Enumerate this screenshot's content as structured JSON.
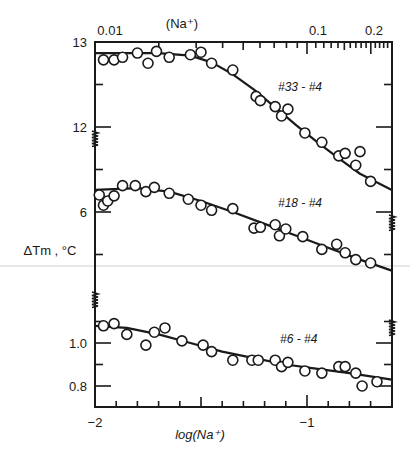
{
  "chart_data": {
    "type": "scatter",
    "title": "",
    "xlabel": "log(Na⁺)",
    "x2label": "(Na⁺)",
    "ylabel": "ΔTm , °C",
    "xlim": [
      -2.0,
      -0.6
    ],
    "x_ticks_bottom": [
      {
        "value": -2,
        "label": "−2"
      },
      {
        "value": -1,
        "label": "−1"
      }
    ],
    "x_ticks_top": [
      {
        "value": 0.01,
        "label": "0.01"
      },
      {
        "value": 0.1,
        "label": "0.1"
      },
      {
        "value": 0.2,
        "label": "0.2"
      }
    ],
    "grid": false,
    "axis_breaks": true,
    "panels": [
      {
        "name": "#33 - #4",
        "ylim": [
          11.2,
          13.0
        ],
        "y_ticks": [
          {
            "value": 13,
            "label": "13"
          },
          {
            "value": 12,
            "label": "12"
          }
        ],
        "y_minor": [
          12.5
        ],
        "points": [
          [
            -1.96,
            12.79
          ],
          [
            -1.91,
            12.79
          ],
          [
            -1.87,
            12.82
          ],
          [
            -1.8,
            12.87
          ],
          [
            -1.75,
            12.75
          ],
          [
            -1.71,
            12.89
          ],
          [
            -1.65,
            12.82
          ],
          [
            -1.55,
            12.85
          ],
          [
            -1.5,
            12.88
          ],
          [
            -1.45,
            12.75
          ],
          [
            -1.35,
            12.67
          ],
          [
            -1.24,
            12.36
          ],
          [
            -1.22,
            12.31
          ],
          [
            -1.15,
            12.24
          ],
          [
            -1.12,
            12.13
          ],
          [
            -1.09,
            12.21
          ],
          [
            -1.01,
            11.93
          ],
          [
            -0.93,
            11.82
          ],
          [
            -0.85,
            11.66
          ],
          [
            -0.82,
            11.69
          ],
          [
            -0.77,
            11.55
          ],
          [
            -0.75,
            11.71
          ],
          [
            -0.7,
            11.36
          ]
        ],
        "fit": [
          [
            -2.0,
            12.87
          ],
          [
            -1.7,
            12.87
          ],
          [
            -1.55,
            12.84
          ],
          [
            -1.45,
            12.76
          ],
          [
            -1.35,
            12.62
          ],
          [
            -1.25,
            12.44
          ],
          [
            -1.15,
            12.23
          ],
          [
            -1.05,
            12.02
          ],
          [
            -0.95,
            11.82
          ],
          [
            -0.85,
            11.63
          ],
          [
            -0.75,
            11.45
          ],
          [
            -0.6,
            11.26
          ]
        ]
      },
      {
        "name": "#18 - #4",
        "ylim": [
          5.0,
          6.8
        ],
        "y_ticks": [
          {
            "value": 6,
            "label": "6"
          }
        ],
        "y_minor": [
          6.5,
          5.5
        ],
        "points": [
          [
            -1.98,
            6.2
          ],
          [
            -1.96,
            6.08
          ],
          [
            -1.94,
            6.13
          ],
          [
            -1.91,
            6.19
          ],
          [
            -1.87,
            6.31
          ],
          [
            -1.81,
            6.31
          ],
          [
            -1.76,
            6.24
          ],
          [
            -1.72,
            6.29
          ],
          [
            -1.65,
            6.22
          ],
          [
            -1.56,
            6.15
          ],
          [
            -1.5,
            6.08
          ],
          [
            -1.45,
            6.02
          ],
          [
            -1.35,
            6.04
          ],
          [
            -1.25,
            5.81
          ],
          [
            -1.22,
            5.82
          ],
          [
            -1.15,
            5.85
          ],
          [
            -1.13,
            5.72
          ],
          [
            -1.1,
            5.8
          ],
          [
            -1.02,
            5.71
          ],
          [
            -0.93,
            5.56
          ],
          [
            -0.86,
            5.62
          ],
          [
            -0.82,
            5.52
          ],
          [
            -0.77,
            5.44
          ],
          [
            -0.7,
            5.4
          ]
        ],
        "fit": [
          [
            -2.0,
            6.26
          ],
          [
            -1.8,
            6.28
          ],
          [
            -1.65,
            6.24
          ],
          [
            -1.5,
            6.13
          ],
          [
            -1.35,
            6.0
          ],
          [
            -1.2,
            5.86
          ],
          [
            -1.05,
            5.72
          ],
          [
            -0.9,
            5.58
          ],
          [
            -0.75,
            5.44
          ],
          [
            -0.6,
            5.31
          ]
        ]
      },
      {
        "name": "#6 - #4",
        "ylim": [
          0.7,
          1.2
        ],
        "y_ticks": [
          {
            "value": 1.0,
            "label": "1.0"
          },
          {
            "value": 0.8,
            "label": "0.8"
          }
        ],
        "y_minor": [
          1.1,
          0.9
        ],
        "points": [
          [
            -1.96,
            1.08
          ],
          [
            -1.91,
            1.09
          ],
          [
            -1.85,
            1.04
          ],
          [
            -1.76,
            0.99
          ],
          [
            -1.72,
            1.05
          ],
          [
            -1.67,
            1.07
          ],
          [
            -1.59,
            1.01
          ],
          [
            -1.49,
            0.99
          ],
          [
            -1.45,
            0.96
          ],
          [
            -1.35,
            0.92
          ],
          [
            -1.26,
            0.92
          ],
          [
            -1.23,
            0.92
          ],
          [
            -1.15,
            0.92
          ],
          [
            -1.12,
            0.89
          ],
          [
            -1.09,
            0.91
          ],
          [
            -1.01,
            0.87
          ],
          [
            -0.93,
            0.86
          ],
          [
            -0.85,
            0.89
          ],
          [
            -0.82,
            0.89
          ],
          [
            -0.77,
            0.86
          ],
          [
            -0.74,
            0.8
          ],
          [
            -0.67,
            0.82
          ]
        ],
        "fit": [
          [
            -2.0,
            1.08
          ],
          [
            -1.85,
            1.07
          ],
          [
            -1.7,
            1.04
          ],
          [
            -1.55,
            1.0
          ],
          [
            -1.4,
            0.96
          ],
          [
            -1.25,
            0.93
          ],
          [
            -1.1,
            0.9
          ],
          [
            -0.95,
            0.88
          ],
          [
            -0.8,
            0.86
          ],
          [
            -0.6,
            0.83
          ]
        ]
      }
    ]
  }
}
